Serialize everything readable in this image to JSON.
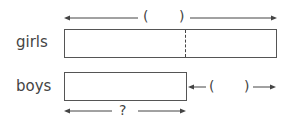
{
  "diagram": {
    "type": "bar-model",
    "rows": [
      {
        "label": "girls",
        "top_bracket": {
          "open": "(",
          "close": ")"
        }
      },
      {
        "label": "boys",
        "side_bracket": {
          "open": "(",
          "close": ")"
        },
        "bottom_label": "?"
      }
    ]
  }
}
